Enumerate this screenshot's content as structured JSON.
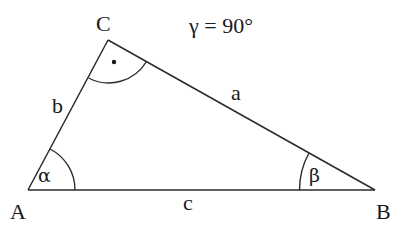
{
  "diagram": {
    "type": "right-triangle",
    "annotation": "γ = 90°",
    "vertices": {
      "A": {
        "label": "A"
      },
      "B": {
        "label": "B"
      },
      "C": {
        "label": "C"
      }
    },
    "sides": {
      "a": {
        "label": "a",
        "between": "B-C"
      },
      "b": {
        "label": "b",
        "between": "A-C"
      },
      "c": {
        "label": "c",
        "between": "A-B"
      }
    },
    "angles": {
      "alpha": {
        "label": "α",
        "at": "A"
      },
      "beta": {
        "label": "β",
        "at": "B"
      },
      "gamma": {
        "label": "γ",
        "at": "C",
        "value": "90°",
        "right_angle_marker": "dot"
      }
    },
    "colors": {
      "stroke": "#2a2a2a",
      "text": "#1a1a1a",
      "background": "#ffffff"
    }
  }
}
